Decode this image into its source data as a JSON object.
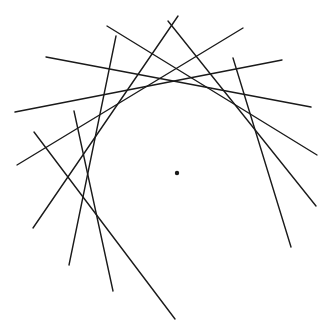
{
  "diagram": {
    "width": 330,
    "height": 333,
    "background": "#ffffff",
    "stroke_color": "#1a1a1a",
    "stroke_width": 1.4,
    "center_point": {
      "x": 177,
      "y": 173,
      "r": 2.2
    },
    "lines": [
      {
        "x1": 107,
        "y1": 26,
        "x2": 317,
        "y2": 155
      },
      {
        "x1": 46,
        "y1": 57,
        "x2": 311,
        "y2": 107
      },
      {
        "x1": 15,
        "y1": 112,
        "x2": 282,
        "y2": 60
      },
      {
        "x1": 116,
        "y1": 36,
        "x2": 69,
        "y2": 265
      },
      {
        "x1": 17,
        "y1": 165,
        "x2": 243,
        "y2": 28
      },
      {
        "x1": 178,
        "y1": 16,
        "x2": 33,
        "y2": 228
      },
      {
        "x1": 168,
        "y1": 21,
        "x2": 316,
        "y2": 206
      },
      {
        "x1": 233,
        "y1": 58,
        "x2": 291,
        "y2": 247
      },
      {
        "x1": 74,
        "y1": 111,
        "x2": 113,
        "y2": 291
      },
      {
        "x1": 34,
        "y1": 132,
        "x2": 175,
        "y2": 319
      }
    ]
  }
}
